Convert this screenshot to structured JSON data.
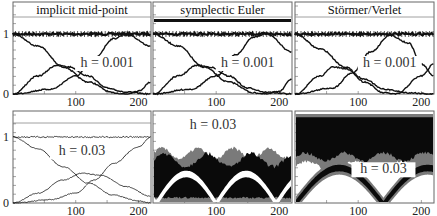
{
  "figure": {
    "columns": [
      "implicit mid-point",
      "symplectic Euler",
      "Störmer/Verlet"
    ],
    "rows": [
      {
        "h_label": "h = 0.001",
        "h": "0.001"
      },
      {
        "h_label": "h = 0.03",
        "h": "0.03"
      }
    ],
    "y_ticks": [
      "0",
      "1"
    ],
    "x_ticks": [
      "100",
      "200"
    ],
    "colors": {
      "line": "#111111",
      "band_dark": "#0a0a0a",
      "band_gray": "#7a7a7a",
      "frame": "#555555"
    }
  },
  "chart_data": [
    {
      "type": "line",
      "panel": "top-left",
      "title": "implicit mid-point",
      "annotation": "h = 0.001",
      "xlim": [
        0,
        220
      ],
      "ylim": [
        0,
        1.3
      ],
      "x_ticks": [
        100,
        200
      ],
      "y_ticks": [
        0,
        1
      ],
      "series": [
        {
          "name": "total (≈1)",
          "x": [
            0,
            50,
            100,
            150,
            200,
            220
          ],
          "values": [
            1,
            1,
            1,
            1,
            1,
            1
          ]
        },
        {
          "name": "component A (decreasing)",
          "x": [
            0,
            40,
            80,
            120,
            160,
            180,
            200,
            220
          ],
          "values": [
            1,
            0.8,
            0.45,
            0.2,
            0.02,
            0.0,
            0.05,
            0.2
          ]
        },
        {
          "name": "component B (hump)",
          "x": [
            0,
            40,
            70,
            90,
            120,
            150,
            180,
            220
          ],
          "values": [
            0,
            0.3,
            0.48,
            0.45,
            0.3,
            0.1,
            0.03,
            0.0
          ]
        },
        {
          "name": "component C (rising)",
          "x": [
            0,
            60,
            100,
            130,
            160,
            180,
            220
          ],
          "values": [
            0,
            0.08,
            0.3,
            0.6,
            0.92,
            1.0,
            0.8
          ]
        }
      ]
    },
    {
      "type": "line",
      "panel": "top-middle",
      "title": "symplectic Euler",
      "annotation": "h = 0.001",
      "xlim": [
        0,
        220
      ],
      "ylim": [
        0,
        1.3
      ],
      "x_ticks": [
        100,
        200
      ],
      "y_ticks": [
        0,
        1
      ],
      "series": [
        {
          "name": "total (≈1)",
          "x": [
            0,
            220
          ],
          "values": [
            1,
            1
          ]
        },
        {
          "name": "component A (decreasing)",
          "x": [
            0,
            40,
            80,
            120,
            160,
            180,
            200,
            220
          ],
          "values": [
            1,
            0.8,
            0.45,
            0.2,
            0.02,
            0.0,
            0.05,
            0.25
          ]
        },
        {
          "name": "component B (hump)",
          "x": [
            0,
            40,
            70,
            90,
            120,
            150,
            180,
            220
          ],
          "values": [
            0,
            0.3,
            0.48,
            0.45,
            0.3,
            0.1,
            0.03,
            0.0
          ]
        },
        {
          "name": "component C (rising)",
          "x": [
            0,
            60,
            100,
            130,
            160,
            180,
            220
          ],
          "values": [
            0,
            0.08,
            0.3,
            0.65,
            0.95,
            1.0,
            0.7
          ]
        }
      ]
    },
    {
      "type": "line",
      "panel": "top-right",
      "title": "Störmer/Verlet",
      "annotation": "h = 0.001",
      "xlim": [
        0,
        220
      ],
      "ylim": [
        0,
        1.3
      ],
      "x_ticks": [
        100,
        200
      ],
      "y_ticks": [
        0,
        1
      ],
      "series": [
        {
          "name": "total (≈1)",
          "x": [
            0,
            220
          ],
          "values": [
            1,
            1
          ]
        },
        {
          "name": "component A (decreasing)",
          "x": [
            0,
            40,
            80,
            110,
            140,
            160,
            200,
            220
          ],
          "values": [
            1,
            0.75,
            0.45,
            0.2,
            0.02,
            0.0,
            0.3,
            0.5
          ]
        },
        {
          "name": "component B (hump)",
          "x": [
            0,
            40,
            60,
            80,
            110,
            140,
            180,
            220
          ],
          "values": [
            0,
            0.3,
            0.45,
            0.42,
            0.25,
            0.08,
            0.02,
            0.0
          ]
        },
        {
          "name": "component C (rising)",
          "x": [
            0,
            60,
            90,
            120,
            150,
            180,
            200,
            220
          ],
          "values": [
            0,
            0.1,
            0.35,
            0.7,
            0.98,
            0.85,
            0.5,
            0.3
          ]
        }
      ]
    },
    {
      "type": "line",
      "panel": "bottom-left",
      "title": "implicit mid-point",
      "annotation": "h = 0.03",
      "xlim": [
        0,
        220
      ],
      "ylim": [
        0,
        1.3
      ],
      "x_ticks": [
        100,
        200
      ],
      "y_ticks": [
        0,
        1
      ],
      "series": [
        {
          "name": "total (≈1)",
          "x": [
            0,
            220
          ],
          "values": [
            1,
            1
          ]
        },
        {
          "name": "component A (decreasing)",
          "x": [
            0,
            40,
            80,
            120,
            160,
            200,
            220
          ],
          "values": [
            1,
            0.82,
            0.55,
            0.3,
            0.12,
            0.03,
            0.0
          ]
        },
        {
          "name": "component B (hump)",
          "x": [
            0,
            40,
            80,
            110,
            140,
            180,
            220
          ],
          "values": [
            0,
            0.15,
            0.35,
            0.45,
            0.42,
            0.25,
            0.1
          ]
        },
        {
          "name": "component C (rising)",
          "x": [
            0,
            60,
            100,
            130,
            160,
            200,
            220
          ],
          "values": [
            0,
            0.05,
            0.15,
            0.35,
            0.6,
            0.85,
            1.0
          ]
        }
      ]
    },
    {
      "type": "area",
      "panel": "bottom-middle",
      "title": "symplectic Euler",
      "annotation": "h = 0.03",
      "xlim": [
        0,
        220
      ],
      "ylim": [
        0,
        1.3
      ],
      "x_ticks": [
        100,
        200
      ],
      "note": "dense oscillating bands (black and gray) between y≈0 and y≈0.8"
    },
    {
      "type": "area",
      "panel": "bottom-right",
      "title": "Störmer/Verlet",
      "annotation": "h = 0.03",
      "xlim": [
        0,
        220
      ],
      "ylim": [
        0,
        1.3
      ],
      "x_ticks": [
        100,
        200
      ],
      "note": "dense oscillating bands filling upper region and V-shaped band touching 0 at x≈140"
    }
  ]
}
